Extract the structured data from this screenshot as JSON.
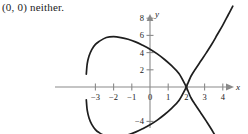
{
  "answer": {
    "text": "(0, 0) neither."
  },
  "chart_data": {
    "type": "line",
    "title": "",
    "subtitle": "",
    "xlabel": "x",
    "ylabel": "y",
    "xlim": [
      -4.2,
      4.8
    ],
    "ylim": [
      -7.0,
      9.4
    ],
    "grid": false,
    "legend": null,
    "x_ticks": [
      -3,
      -2,
      -1,
      0,
      1,
      2,
      3,
      4
    ],
    "x_tick_labels": [
      "-3",
      "-2",
      "-1",
      "0",
      "1",
      "2",
      "3",
      "4"
    ],
    "y_ticks": [
      -6,
      -4,
      2,
      4,
      6,
      8
    ],
    "y_tick_labels": [
      "-6",
      "-4",
      "2",
      "4",
      "6",
      "8"
    ],
    "annotations": [
      {
        "label": "self-intersection",
        "x": 2,
        "y": 0
      }
    ],
    "series": [
      {
        "name": "curve-upper",
        "comment": "upper branch: from loop crossing at (2,0) leftward over the top of the loop and back down",
        "x": [
          2.0,
          1.6,
          1.2,
          0.8,
          0.4,
          0.0,
          -0.4,
          -0.8,
          -1.2,
          -1.6,
          -2.0,
          -2.4,
          -2.8,
          -3.0,
          -3.2,
          -3.35,
          -3.45,
          -3.5
        ],
        "y": [
          0.0,
          1.55,
          2.45,
          3.2,
          3.85,
          4.4,
          4.85,
          5.25,
          5.55,
          5.75,
          5.85,
          5.75,
          5.3,
          4.95,
          4.35,
          3.6,
          2.7,
          1.5
        ]
      },
      {
        "name": "curve-lower",
        "comment": "lower branch mirrors upper, completing the loop back to (2,0)",
        "x": [
          -3.5,
          -3.45,
          -3.35,
          -3.2,
          -3.0,
          -2.8,
          -2.4,
          -2.0,
          -1.6,
          -1.2,
          -0.8,
          -0.4,
          0.0,
          0.4,
          0.8,
          1.2,
          1.6,
          2.0
        ],
        "y": [
          -1.5,
          -2.7,
          -3.6,
          -4.35,
          -4.95,
          -5.3,
          -5.75,
          -5.85,
          -5.75,
          -5.55,
          -5.25,
          -4.85,
          -4.4,
          -3.85,
          -3.2,
          -2.45,
          -1.55,
          0.0
        ]
      },
      {
        "name": "branch-up-right",
        "comment": "branch leaving the node upward to the right",
        "x": [
          2.0,
          2.25,
          2.5,
          2.8,
          3.1,
          3.4,
          3.7,
          4.0,
          4.3,
          4.55
        ],
        "y": [
          0.0,
          1.25,
          2.1,
          3.05,
          4.0,
          5.0,
          6.1,
          7.2,
          8.4,
          9.4
        ]
      },
      {
        "name": "branch-down-right",
        "comment": "branch leaving the node downward to the right",
        "x": [
          2.0,
          2.25,
          2.5,
          2.8,
          3.1,
          3.4,
          3.7,
          4.0,
          4.25
        ],
        "y": [
          0.0,
          -1.25,
          -2.1,
          -3.05,
          -4.0,
          -5.0,
          -6.1,
          -7.2,
          -8.2
        ]
      }
    ]
  },
  "style": {
    "axis_color": "#8a8a8a",
    "curve_color": "#1e1e1e",
    "text_color": "#1b1b1b",
    "background": "#ffffff"
  }
}
